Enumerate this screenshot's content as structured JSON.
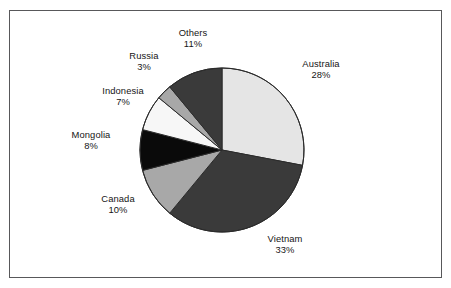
{
  "figure": {
    "clipped_caption_sliver": "",
    "frame_color": "#58585a",
    "background": "#ffffff"
  },
  "chart_data": {
    "type": "pie",
    "title": "",
    "subtitle": "",
    "xlabel": "",
    "ylabel": "",
    "legend_position": "none",
    "labels_position": "outside",
    "unit": "%",
    "start_angle_deg": 0,
    "direction": "clockwise",
    "categories": [
      "Australia",
      "Vietnam",
      "Canada",
      "Mongolia",
      "Indonesia",
      "Russia",
      "Others"
    ],
    "values": [
      28,
      33,
      10,
      8,
      7,
      3,
      11
    ],
    "total": 100,
    "slices": [
      {
        "name": "Australia",
        "value": 28,
        "label_name": "Australia",
        "label_pct": "28%",
        "color": "#e5e5e5",
        "stroke": "#2b2b2b"
      },
      {
        "name": "Vietnam",
        "value": 33,
        "label_name": "Vietnam",
        "label_pct": "33%",
        "color": "#3a3a3a",
        "stroke": "#2b2b2b"
      },
      {
        "name": "Canada",
        "value": 10,
        "label_name": "Canada",
        "label_pct": "10%",
        "color": "#a8a8a8",
        "stroke": "#2b2b2b"
      },
      {
        "name": "Mongolia",
        "value": 8,
        "label_name": "Mongolia",
        "label_pct": "8%",
        "color": "#0a0a0a",
        "stroke": "#2b2b2b"
      },
      {
        "name": "Indonesia",
        "value": 7,
        "label_name": "Indonesia",
        "label_pct": "7%",
        "color": "#f7f7f7",
        "stroke": "#2b2b2b"
      },
      {
        "name": "Russia",
        "value": 3,
        "label_name": "Russia",
        "label_pct": "3%",
        "color": "#a8a8a8",
        "stroke": "#2b2b2b"
      },
      {
        "name": "Others",
        "value": 11,
        "label_name": "Others",
        "label_pct": "11%",
        "color": "#3a3a3a",
        "stroke": "#2b2b2b"
      }
    ]
  }
}
